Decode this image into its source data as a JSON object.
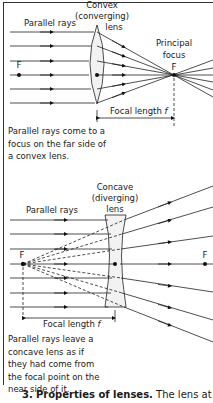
{
  "convex": {
    "title_line1": "Convex",
    "title_line2": "(converging)",
    "title_line3": "lens",
    "parallel_rays_label": "Parallel rays",
    "principal_focus_line1": "Principal",
    "principal_focus_line2": "focus",
    "focus_left_label": "F",
    "focus_right_label": "F",
    "focal_length_label": "Focal length ",
    "focal_length_symbol": "f",
    "caption": "Parallel rays come to a focus on the far side of a convex lens."
  },
  "concave": {
    "title_line1": "Concave",
    "title_line2": "(diverging)",
    "title_line3": "lens",
    "parallel_rays_label": "Parallel rays",
    "focus_left_label": "F",
    "focus_right_label": "F",
    "focal_length_label": "Focal length ",
    "focal_length_symbol": "f",
    "caption": "Parallel rays leave a concave lens as if they had come from the focal point on the near side of it."
  },
  "bottom_text": {
    "number": "3.",
    "heading": "Properties of lenses.",
    "body": " The lens at the"
  }
}
